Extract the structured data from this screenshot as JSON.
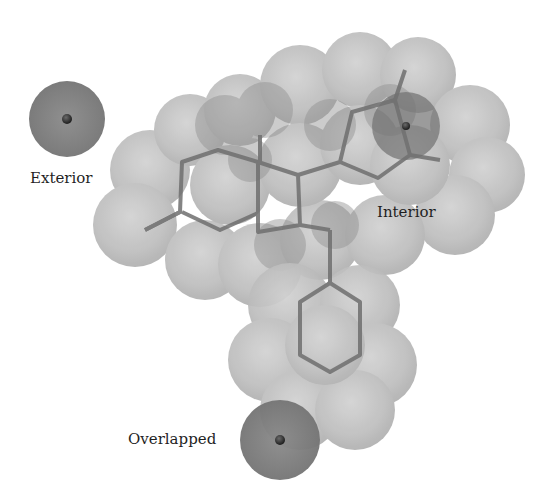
{
  "figure": {
    "type": "molecular-surface-diagram",
    "colors": {
      "surface_sphere": "#b9b9b9",
      "surface_sphere_dark": "#8e8e8e",
      "probe_sphere": "#7c7c7c",
      "probe_core": "#333333",
      "bond": "#6f6f6f",
      "background": "#ffffff",
      "text": "#1f1f1f"
    },
    "probes": [
      {
        "id": "exterior",
        "label": "Exterior",
        "cx": 67,
        "cy": 119,
        "r": 38
      },
      {
        "id": "interior",
        "label": "Interior",
        "cx": 406,
        "cy": 126,
        "r": 34
      },
      {
        "id": "overlapped",
        "label": "Overlapped",
        "cx": 280,
        "cy": 440,
        "r": 40
      }
    ]
  },
  "labels": {
    "exterior": "Exterior",
    "interior": "Interior",
    "overlapped": "Overlapped"
  }
}
